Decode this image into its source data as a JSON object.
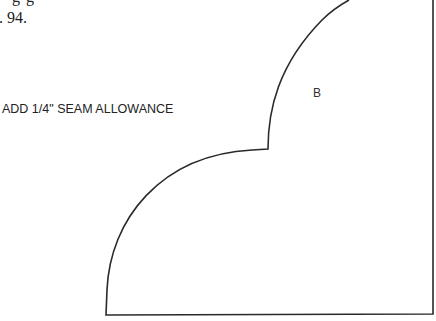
{
  "document": {
    "top_fragment": "g   g",
    "page_reference": ". 94.",
    "seam_note": "ADD 1/4\" SEAM ALLOWANCE",
    "pattern_piece": {
      "label": "B",
      "line_color": "#2a2a2a",
      "background": "#ffffff"
    }
  }
}
